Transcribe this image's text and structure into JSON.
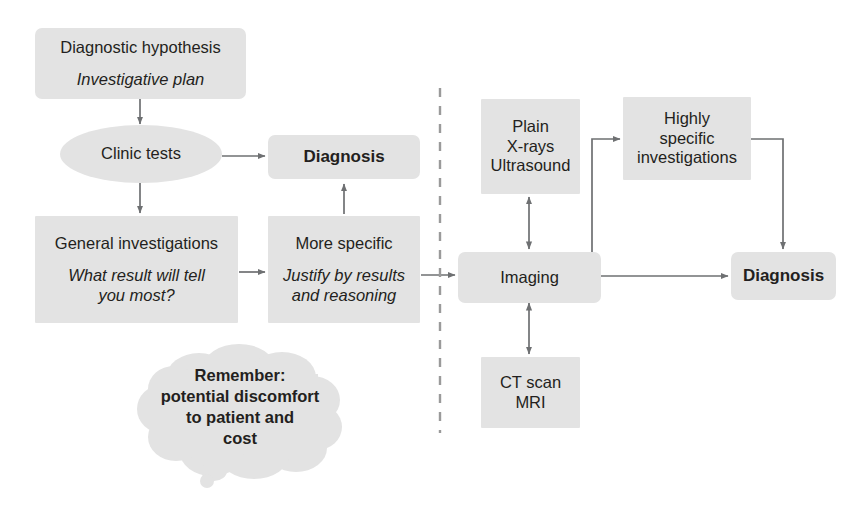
{
  "diagram": {
    "colors": {
      "node_fill": "#e3e3e3",
      "text": "#231f20",
      "connector": "#6e7072",
      "divider": "#9a9a9a",
      "background": "#ffffff"
    },
    "divider": {
      "name": "dashed-vertical-divider",
      "orientation": "vertical",
      "style": "dashed"
    },
    "nodes": [
      {
        "id": "diagnostic-hypothesis",
        "shape": "rounded-rect",
        "lines": [
          {
            "text": "Diagnostic hypothesis",
            "style": "title"
          },
          {
            "text": "Investigative plan",
            "style": "italic"
          }
        ]
      },
      {
        "id": "clinic-tests",
        "shape": "ellipse",
        "lines": [
          {
            "text": "Clinic tests",
            "style": "plain"
          }
        ]
      },
      {
        "id": "diagnosis-left",
        "shape": "rounded-rect",
        "lines": [
          {
            "text": "Diagnosis",
            "style": "bold"
          }
        ]
      },
      {
        "id": "general-investigations",
        "shape": "sharp-rect",
        "lines": [
          {
            "text": "General investigations",
            "style": "title"
          },
          {
            "text": "What result will tell",
            "style": "italic"
          },
          {
            "text": "you most?",
            "style": "italic"
          }
        ]
      },
      {
        "id": "more-specific",
        "shape": "sharp-rect",
        "lines": [
          {
            "text": "More specific",
            "style": "title"
          },
          {
            "text": "Justify by results",
            "style": "italic"
          },
          {
            "text": "and reasoning",
            "style": "italic"
          }
        ]
      },
      {
        "id": "plain-xrays-ultrasound",
        "shape": "sharp-rect",
        "lines": [
          {
            "text": "Plain",
            "style": "plain"
          },
          {
            "text": "X-rays",
            "style": "plain"
          },
          {
            "text": "Ultrasound",
            "style": "plain"
          }
        ]
      },
      {
        "id": "highly-specific-investigations",
        "shape": "sharp-rect",
        "lines": [
          {
            "text": "Highly",
            "style": "plain"
          },
          {
            "text": "specific",
            "style": "plain"
          },
          {
            "text": "investigations",
            "style": "plain"
          }
        ]
      },
      {
        "id": "imaging",
        "shape": "rounded-rect",
        "lines": [
          {
            "text": "Imaging",
            "style": "plain"
          }
        ]
      },
      {
        "id": "diagnosis-right",
        "shape": "rounded-rect",
        "lines": [
          {
            "text": "Diagnosis",
            "style": "bold"
          }
        ]
      },
      {
        "id": "ct-scan-mri",
        "shape": "sharp-rect",
        "lines": [
          {
            "text": "CT scan",
            "style": "plain"
          },
          {
            "text": "MRI",
            "style": "plain"
          }
        ]
      },
      {
        "id": "remember-cloud",
        "shape": "thought-cloud",
        "lines": [
          {
            "text": "Remember:",
            "style": "bold"
          },
          {
            "text": "potential discomfort",
            "style": "bold"
          },
          {
            "text": "to patient and",
            "style": "bold"
          },
          {
            "text": "cost",
            "style": "bold"
          }
        ]
      }
    ],
    "edges": [
      {
        "id": "hypothesis-to-clinic-tests",
        "from": "diagnostic-hypothesis",
        "to": "clinic-tests",
        "arrow": "single"
      },
      {
        "id": "clinic-tests-to-diagnosis-left",
        "from": "clinic-tests",
        "to": "diagnosis-left",
        "arrow": "single"
      },
      {
        "id": "clinic-tests-to-general-investigations",
        "from": "clinic-tests",
        "to": "general-investigations",
        "arrow": "single"
      },
      {
        "id": "general-investigations-to-more-specific",
        "from": "general-investigations",
        "to": "more-specific",
        "arrow": "single"
      },
      {
        "id": "more-specific-to-diagnosis-left",
        "from": "more-specific",
        "to": "diagnosis-left",
        "arrow": "single"
      },
      {
        "id": "more-specific-to-imaging",
        "from": "more-specific",
        "to": "imaging",
        "arrow": "single"
      },
      {
        "id": "imaging-to-plain-xrays",
        "from": "imaging",
        "to": "plain-xrays-ultrasound",
        "arrow": "double"
      },
      {
        "id": "imaging-to-ct-scan",
        "from": "imaging",
        "to": "ct-scan-mri",
        "arrow": "double"
      },
      {
        "id": "imaging-to-highly-specific",
        "from": "imaging",
        "to": "highly-specific-investigations",
        "arrow": "single"
      },
      {
        "id": "highly-specific-to-diagnosis-right",
        "from": "highly-specific-investigations",
        "to": "diagnosis-right",
        "arrow": "single"
      },
      {
        "id": "imaging-to-diagnosis-right",
        "from": "imaging",
        "to": "diagnosis-right",
        "arrow": "single"
      }
    ]
  }
}
